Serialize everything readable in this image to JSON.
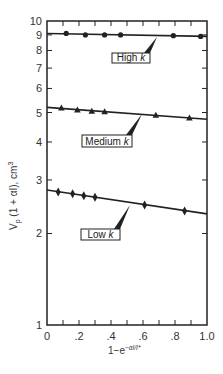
{
  "chart_data": {
    "type": "scatter",
    "title": "",
    "xlabel": "1−e^(−αI/I*)",
    "xlabel_base": "1−e",
    "xlabel_sup": "−αI/I*",
    "ylabel": "V_p (1 + αI), cm³",
    "ylabel_main": "V",
    "ylabel_sub": "p",
    "ylabel_rest": " (1 + αI), cm",
    "ylabel_sup": "3",
    "xlim": [
      0,
      1.0
    ],
    "ylim": [
      1,
      10
    ],
    "yscale": "log",
    "grid": false,
    "legend": "inline labels",
    "x_ticks": [
      "0",
      ".2",
      ".4",
      ".6",
      ".8",
      "1.0"
    ],
    "y_ticks": [
      "1",
      "2",
      "3",
      "4",
      "5",
      "6",
      "7",
      "8",
      "9",
      "10"
    ],
    "series": [
      {
        "name": "High k",
        "marker": "circle",
        "x": [
          0.12,
          0.24,
          0.36,
          0.46,
          0.79,
          0.96
        ],
        "y": [
          9.1,
          9.0,
          9.0,
          9.0,
          8.95,
          8.9
        ],
        "fit": {
          "x": [
            0,
            1.0
          ],
          "y": [
            9.1,
            8.9
          ]
        },
        "label_box": {
          "x": 112,
          "y": 53,
          "w": 38,
          "h": 10
        },
        "leader_to": {
          "x": 157,
          "y": 37
        }
      },
      {
        "name": "Medium k",
        "marker": "triangle",
        "x": [
          0.09,
          0.19,
          0.28,
          0.36,
          0.68,
          0.89
        ],
        "y": [
          5.17,
          5.1,
          5.05,
          5.03,
          4.9,
          4.8
        ],
        "fit": {
          "x": [
            0,
            1.0
          ],
          "y": [
            5.2,
            4.75
          ]
        },
        "label_box": {
          "x": 82,
          "y": 135,
          "w": 50,
          "h": 12
        },
        "leader_to": {
          "x": 142,
          "y": 114
        }
      },
      {
        "name": "Low k",
        "marker": "diamond",
        "x": [
          0.07,
          0.16,
          0.23,
          0.3,
          0.61,
          0.86
        ],
        "y": [
          2.74,
          2.7,
          2.66,
          2.63,
          2.48,
          2.37
        ],
        "fit": {
          "x": [
            0,
            1.0
          ],
          "y": [
            2.78,
            2.32
          ]
        },
        "label_box": {
          "x": 81,
          "y": 229,
          "w": 39,
          "h": 11
        },
        "leader_to": {
          "x": 130,
          "y": 205
        }
      }
    ]
  },
  "labels": {
    "high": "High k",
    "medium": "Medium k",
    "low": "Low k"
  },
  "colors": {
    "ink": "#222222",
    "background": "#ffffff"
  }
}
